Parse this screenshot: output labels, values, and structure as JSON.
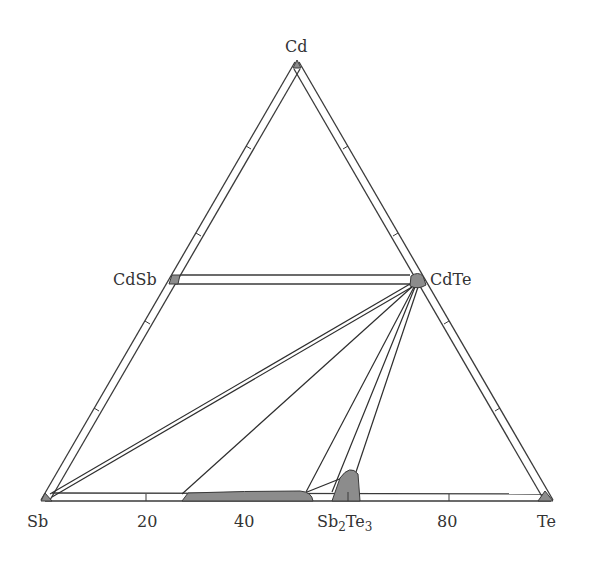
{
  "diagram": {
    "type": "ternary-phase-diagram",
    "system": "Cd-Sb-Te",
    "vertices": {
      "top": "Cd",
      "left": "Sb",
      "right": "Te"
    },
    "compounds": {
      "cdsb": "CdSb",
      "cdte": "CdTe",
      "sb2te3_base": "Sb",
      "sb2te3_sub1": "2",
      "sb2te3_mid": "Te",
      "sb2te3_sub2": "3"
    },
    "axis": {
      "tick_labels": [
        "20",
        "40",
        "80"
      ],
      "tick_values": [
        20,
        40,
        80
      ]
    },
    "colors": {
      "line": "#3a3a3a",
      "phase_fill": "#8c8c8c",
      "background": "#ffffff"
    }
  }
}
